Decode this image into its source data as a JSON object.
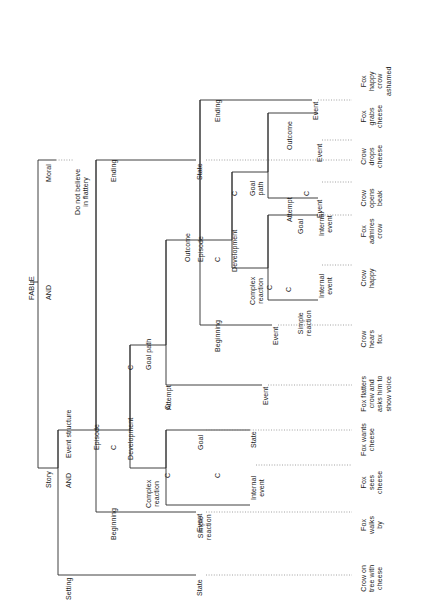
{
  "figure": {
    "title": "FABLE",
    "orientation": "rotated-90-ccw",
    "root_label": "FABLE"
  },
  "nodes": {
    "root": "FABLE",
    "and_1": "AND",
    "story": "Story",
    "moral": "Moral",
    "moral_text": "Do not believe\nin flattery",
    "and_2": "AND",
    "setting": "Setting",
    "event_structure": "Event structure",
    "c_1": "C",
    "episode_outer": "Episode",
    "beginning_outer": "Beginning",
    "c_2": "C",
    "development_outer": "Development",
    "c_3": "C",
    "ending_outer": "Ending",
    "state_setting": "State",
    "event_beginning_outer": "Event",
    "complex_reaction_outer": "Complex\nreaction",
    "c_4": "C",
    "goal_path_outer": "Goal path",
    "simple_reaction_outer": "Simple\nreaction",
    "c_5": "C",
    "goal_outer": "Goal",
    "internal_event_outer": "Internal\nevent",
    "state_goal_outer": "State",
    "attempt_outer": "Attempt",
    "event_attempt_outer": "Event",
    "outcome_outer": "Outcome",
    "episode_inner": "Episode",
    "beginning_inner": "Beginning",
    "c_6": "C",
    "development_inner": "Development",
    "c_7": "C",
    "ending_inner": "Ending",
    "event_beginning_inner": "Event",
    "complex_reaction_inner": "Complex\nreaction",
    "c_8": "C",
    "goal_path_inner": "Goal\npath",
    "simple_reaction_inner": "Simple\nreaction",
    "c_9": "C",
    "goal_inner": "Goal",
    "internal_event_inner_1": "Internal\nevent",
    "internal_event_inner_2": "Internal\nevent",
    "attempt_inner": "Attempt",
    "c_10": "C",
    "outcome_inner": "Outcome",
    "event_attempt_inner": "Event",
    "event_outcome_inner": "Event",
    "event_ending_inner": "Event",
    "state_ending_outer": "State"
  },
  "leaves": [
    {
      "id": "leaf-state-ending",
      "text": "Fox\nhappy\ncrow\nashamed"
    },
    {
      "id": "leaf-event-ending-inner",
      "text": "Fox\ngrabs\ncheese"
    },
    {
      "id": "leaf-event-outcome-inner",
      "text": "Crow\ndrops\ncheese"
    },
    {
      "id": "leaf-event-attempt-inner",
      "text": "Crow\nopens\nbeak"
    },
    {
      "id": "leaf-internal-event-2",
      "text": "Fox\nadmires\ncrow"
    },
    {
      "id": "leaf-internal-event-1",
      "text": "Crow\nhappy"
    },
    {
      "id": "leaf-event-beginning-in",
      "text": "Crow\nhears\nfox"
    },
    {
      "id": "leaf-event-attempt-outer",
      "text": "Fox flatters\ncrow and\nasks him to\nshow voice"
    },
    {
      "id": "leaf-state-goal-outer",
      "text": "Fox wants\ncheese"
    },
    {
      "id": "leaf-internal-event-out",
      "text": "Fox\nsees\ncheese"
    },
    {
      "id": "leaf-event-beginning-out",
      "text": "Fox\nwalks\nby"
    },
    {
      "id": "leaf-state-setting",
      "text": "Crow on\ntree with\ncheese"
    }
  ],
  "colors": {
    "line": "#2b2b2b",
    "leader": "#8a8a8a",
    "text": "#1a1a1a",
    "background": "#ffffff"
  }
}
